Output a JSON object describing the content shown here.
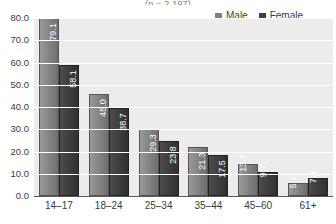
{
  "chart_data": {
    "type": "bar",
    "title": "(n = 2,197)",
    "xlabel": "",
    "ylabel": "",
    "ylim": [
      0,
      80
    ],
    "yticks": [
      "0.0",
      "10.0",
      "20.0",
      "30.0",
      "40.0",
      "50.0",
      "60.0",
      "70.0",
      "80.0"
    ],
    "grid": true,
    "legend_position": "top-right",
    "categories": [
      "14–17",
      "18–24",
      "25–34",
      "35–44",
      "45–60",
      "61+"
    ],
    "series": [
      {
        "name": "Male",
        "color": "#7f7f7f",
        "values": [
          79.1,
          45.0,
          29.3,
          21.3,
          13.7,
          5.1
        ],
        "labels": [
          "79.1",
          "45.0",
          "29.3",
          "21.3",
          "13.7",
          "5.1"
        ]
      },
      {
        "name": "Female",
        "color": "#3f3f3f",
        "values": [
          58.1,
          38.7,
          23.8,
          17.5,
          9.7,
          7.4
        ],
        "labels": [
          "58.1",
          "38.7",
          "23.8",
          "17.5",
          "9.7",
          "7.4"
        ]
      }
    ]
  }
}
